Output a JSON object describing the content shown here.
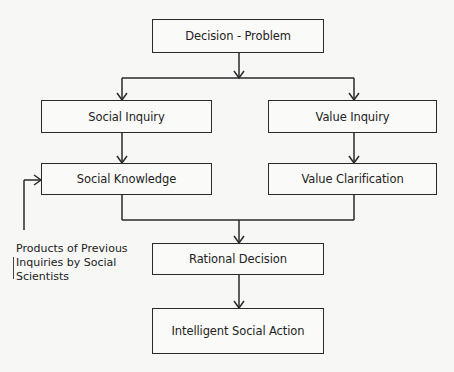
{
  "diagram": {
    "type": "flowchart",
    "nodes": {
      "decision_problem": "Decision - Problem",
      "social_inquiry": "Social Inquiry",
      "value_inquiry": "Value Inquiry",
      "social_knowledge": "Social Knowledge",
      "value_clarification": "Value Clarification",
      "rational_decision": "Rational Decision",
      "intelligent_social_action": "Intelligent Social Action"
    },
    "note": {
      "line1": "Products of Previous",
      "line2": "Inquiries by Social",
      "line3": "Scientists"
    },
    "edges": [
      {
        "from": "Decision - Problem",
        "to": "Social Inquiry"
      },
      {
        "from": "Decision - Problem",
        "to": "Value Inquiry"
      },
      {
        "from": "Social Inquiry",
        "to": "Social Knowledge"
      },
      {
        "from": "Value Inquiry",
        "to": "Value Clarification"
      },
      {
        "from": "Social Knowledge",
        "to": "Rational Decision"
      },
      {
        "from": "Value Clarification",
        "to": "Rational Decision"
      },
      {
        "from": "Rational Decision",
        "to": "Intelligent Social Action"
      },
      {
        "from": "Products of Previous Inquiries by Social Scientists",
        "to": "Social Knowledge"
      }
    ]
  }
}
